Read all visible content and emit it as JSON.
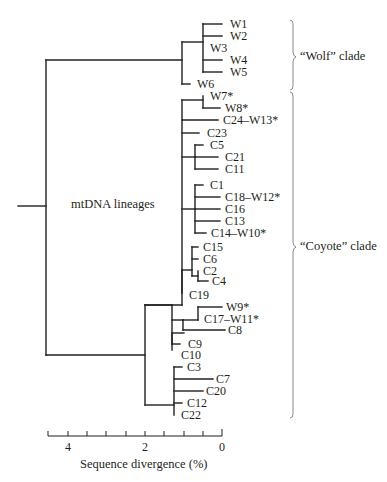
{
  "diagram": {
    "type": "phylogenetic-tree",
    "center_label": "mtDNA lineages",
    "clades": [
      {
        "name": "wolf",
        "label": "“Wolf” clade"
      },
      {
        "name": "coyote",
        "label": "“Coyote” clade"
      }
    ],
    "leaves": [
      {
        "id": "W1",
        "label": "W1"
      },
      {
        "id": "W2",
        "label": "W2"
      },
      {
        "id": "W3",
        "label": "W3"
      },
      {
        "id": "W4",
        "label": "W4"
      },
      {
        "id": "W5",
        "label": "W5"
      },
      {
        "id": "W6",
        "label": "W6"
      },
      {
        "id": "W7",
        "label": "W7*"
      },
      {
        "id": "W8",
        "label": "W8*"
      },
      {
        "id": "C24",
        "label": "C24–W13*"
      },
      {
        "id": "C23",
        "label": "C23"
      },
      {
        "id": "C5",
        "label": "C5"
      },
      {
        "id": "C21",
        "label": "C21"
      },
      {
        "id": "C11",
        "label": "C11"
      },
      {
        "id": "C1",
        "label": "C1"
      },
      {
        "id": "C18",
        "label": "C18–W12*"
      },
      {
        "id": "C16",
        "label": "C16"
      },
      {
        "id": "C13",
        "label": "C13"
      },
      {
        "id": "C14",
        "label": "C14–W10*"
      },
      {
        "id": "C15",
        "label": "C15"
      },
      {
        "id": "C6",
        "label": "C6"
      },
      {
        "id": "C2",
        "label": "C2"
      },
      {
        "id": "C4",
        "label": "C4"
      },
      {
        "id": "C19",
        "label": "C19"
      },
      {
        "id": "W9",
        "label": "W9*"
      },
      {
        "id": "C17",
        "label": "C17–W11*"
      },
      {
        "id": "C8",
        "label": "C8"
      },
      {
        "id": "C9",
        "label": "C9"
      },
      {
        "id": "C10",
        "label": "C10"
      },
      {
        "id": "C3",
        "label": "C3"
      },
      {
        "id": "C7",
        "label": "C7"
      },
      {
        "id": "C20",
        "label": "C20"
      },
      {
        "id": "C12",
        "label": "C12"
      },
      {
        "id": "C22",
        "label": "C22"
      }
    ],
    "axis": {
      "title": "Sequence divergence (%)",
      "tick_labels": [
        "4",
        "2",
        "0"
      ],
      "range": [
        4.5,
        0
      ],
      "minor_step": 0.5
    }
  }
}
